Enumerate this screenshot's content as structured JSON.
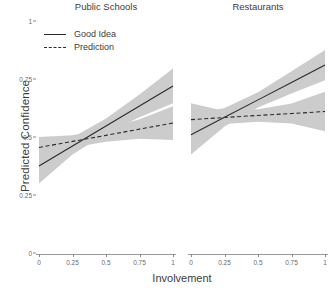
{
  "chart_data": {
    "type": "line",
    "title": "",
    "xlabel": "Involvement",
    "ylabel": "Predicted Confidence",
    "xlim": [
      0,
      1
    ],
    "ylim": [
      0,
      1
    ],
    "xticks": [
      "0",
      "0.25",
      "0.5",
      "0.75",
      "1"
    ],
    "yticks": [
      "0",
      "0.25",
      "0.5",
      "0.75",
      "1"
    ],
    "xtick_values": [
      0,
      0.25,
      0.5,
      0.75,
      1
    ],
    "ytick_values": [
      0,
      0.25,
      0.5,
      0.75,
      1
    ],
    "grid": false,
    "legend_position": "top-left",
    "legend": [
      "Good Idea",
      "Prediction"
    ],
    "facets": [
      {
        "label": "Public Schools",
        "series": [
          {
            "name": "Good Idea",
            "style": "solid",
            "x": [
              0,
              0.25,
              0.5,
              0.75,
              1
            ],
            "values": [
              0.375,
              0.461,
              0.547,
              0.634,
              0.72
            ],
            "ci_lower": [
              0.3,
              0.425,
              0.515,
              0.585,
              0.645
            ],
            "ci_upper": [
              0.45,
              0.498,
              0.58,
              0.683,
              0.795
            ]
          },
          {
            "name": "Prediction",
            "style": "dashed",
            "x": [
              0,
              0.25,
              0.5,
              0.75,
              1
            ],
            "values": [
              0.455,
              0.481,
              0.507,
              0.534,
              0.56
            ],
            "ci_lower": [
              0.41,
              0.455,
              0.48,
              0.492,
              0.487
            ],
            "ci_upper": [
              0.5,
              0.508,
              0.535,
              0.576,
              0.633
            ]
          }
        ]
      },
      {
        "label": "Restaurants",
        "series": [
          {
            "name": "Good Idea",
            "style": "solid",
            "x": [
              0,
              0.25,
              0.5,
              0.75,
              1
            ],
            "values": [
              0.51,
              0.585,
              0.66,
              0.735,
              0.81
            ],
            "ci_lower": [
              0.425,
              0.545,
              0.627,
              0.687,
              0.745
            ],
            "ci_upper": [
              0.595,
              0.625,
              0.693,
              0.783,
              0.875
            ]
          },
          {
            "name": "Prediction",
            "style": "dashed",
            "x": [
              0,
              0.25,
              0.5,
              0.75,
              1
            ],
            "values": [
              0.575,
              0.584,
              0.593,
              0.601,
              0.61
            ],
            "ci_lower": [
              0.505,
              0.556,
              0.566,
              0.558,
              0.525
            ],
            "ci_upper": [
              0.645,
              0.612,
              0.62,
              0.644,
              0.695
            ]
          }
        ]
      }
    ],
    "colors": {
      "line": "#2b2b2b",
      "ribbon": "#cccccc",
      "axis": "#8a8a8a",
      "text": "#3d3d3d",
      "background": "#ffffff"
    }
  }
}
